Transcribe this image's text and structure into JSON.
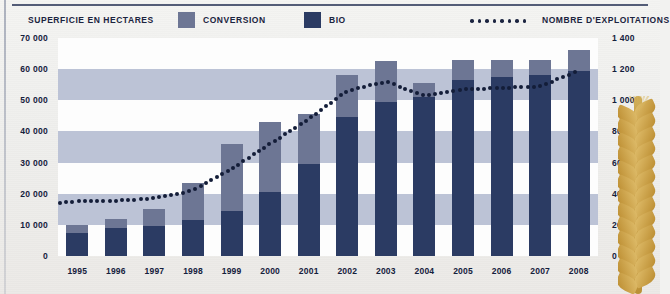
{
  "legend": {
    "title": "SUPERFICIE EN HECTARES",
    "items": [
      {
        "label": "CONVERSION",
        "color": "#6d7694",
        "type": "swatch"
      },
      {
        "label": "BIO",
        "color": "#2b3b63",
        "type": "swatch"
      },
      {
        "label": "NOMBRE D'EXPLOITATIONS",
        "color": "#1b2440",
        "type": "dotted-line"
      }
    ]
  },
  "chart_data": {
    "type": "bar",
    "title": "SUPERFICIE EN HECTARES",
    "xlabel": "",
    "ylabel": "SUPERFICIE EN HECTARES",
    "y2label": "NOMBRE D'EXPLOITATIONS",
    "stacked": true,
    "grid": true,
    "legend_position": "top",
    "categories": [
      "1995",
      "1996",
      "1997",
      "1998",
      "1999",
      "2000",
      "2001",
      "2002",
      "2003",
      "2004",
      "2005",
      "2006",
      "2007",
      "2008"
    ],
    "ylim": [
      0,
      70000
    ],
    "yticks": [
      "0",
      "10 000",
      "20 000",
      "30 000",
      "40 000",
      "50 000",
      "60 000",
      "70 000"
    ],
    "ytick_values": [
      0,
      10000,
      20000,
      30000,
      40000,
      50000,
      60000,
      70000
    ],
    "y2lim": [
      0,
      1400
    ],
    "y2ticks": [
      "0",
      "200",
      "400",
      "600",
      "800",
      "1 000",
      "1 200",
      "1 400"
    ],
    "y2tick_values": [
      0,
      200,
      400,
      600,
      800,
      1000,
      1200,
      1400
    ],
    "series": [
      {
        "name": "BIO",
        "color": "#2b3b63",
        "values": [
          7500,
          9000,
          9500,
          11500,
          14500,
          20500,
          29500,
          44500,
          49500,
          51000,
          56500,
          57500,
          58000,
          59500
        ]
      },
      {
        "name": "CONVERSION",
        "color": "#6d7694",
        "values": [
          2500,
          3000,
          5500,
          12000,
          21500,
          22500,
          16000,
          13500,
          13000,
          4500,
          6500,
          5500,
          5000,
          6500
        ]
      }
    ],
    "totals": [
      10000,
      12000,
      15000,
      23500,
      36000,
      43000,
      45500,
      58000,
      62500,
      55500,
      63000,
      63000,
      63000,
      66000
    ],
    "line_series": {
      "name": "NOMBRE D'EXPLOITATIONS",
      "color": "#131d38",
      "style": "dotted",
      "axis": "right",
      "values": [
        350,
        355,
        370,
        420,
        560,
        720,
        880,
        1060,
        1120,
        1030,
        1070,
        1080,
        1090,
        1190
      ]
    }
  }
}
